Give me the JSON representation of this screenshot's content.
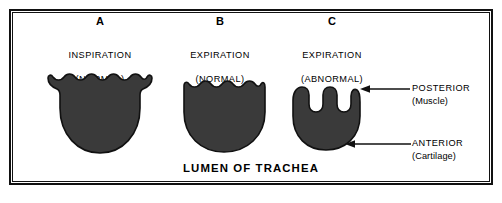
{
  "figure": {
    "main_caption": "LUMEN OF TRACHEA",
    "ink_color": "#1a1a1a",
    "fill_color": "#3a3a3a",
    "background_color": "#ffffff",
    "border_color": "#111111"
  },
  "panels": [
    {
      "letter": "A",
      "line1": "INSPIRATION",
      "line2": "(NORMAL)",
      "shape_name": "trachea-lumen-inspiration-normal"
    },
    {
      "letter": "B",
      "line1": "EXPIRATION",
      "line2": "(NORMAL)",
      "shape_name": "trachea-lumen-expiration-normal"
    },
    {
      "letter": "C",
      "line1": "EXPIRATION",
      "line2": "(ABNORMAL)",
      "shape_name": "trachea-lumen-expiration-abnormal"
    }
  ],
  "annotations": [
    {
      "name": "posterior",
      "main": "POSTERIOR",
      "sub": "(Muscle)"
    },
    {
      "name": "anterior",
      "main": "ANTERIOR",
      "sub": "(Cartilage)"
    }
  ]
}
